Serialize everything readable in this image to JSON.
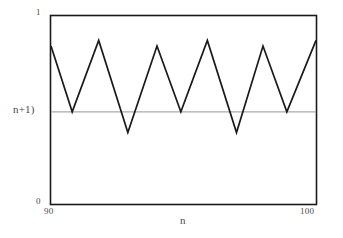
{
  "chart_data": {
    "type": "line",
    "title": "",
    "subtitle": "",
    "xlabel": "n",
    "ylabel": "",
    "xlim": [
      90,
      100
    ],
    "ylim": [
      0,
      1
    ],
    "grid": false,
    "legend": null,
    "xticks": [
      {
        "value": 90,
        "label": "90"
      },
      {
        "value": 100,
        "label": "100"
      }
    ],
    "yticks": [
      {
        "value": 0,
        "label": "0"
      },
      {
        "value": 0.49,
        "label": "n+1)"
      },
      {
        "value": 1,
        "label": "1"
      }
    ],
    "annotations": [
      {
        "name": "reference-line",
        "type": "horizontal-line",
        "y": 0.49,
        "label": "n+1)",
        "color": "#aaaaaa"
      }
    ],
    "series": [
      {
        "name": "oscillating-sequence",
        "color": "#1a1a1a",
        "x": [
          90.0,
          90.5,
          91.0,
          91.5,
          92.0,
          92.5,
          93.0,
          93.5,
          94.0,
          94.5,
          95.0,
          95.5,
          96.0,
          96.5,
          97.0,
          97.5,
          98.0,
          98.5,
          99.0,
          99.5,
          100.0
        ],
        "y": [
          0.84,
          0.49,
          0.87,
          0.38,
          0.84,
          0.49,
          0.85,
          0.38,
          0.87,
          0.49,
          0.85,
          0.38,
          0.84,
          0.49,
          0.87,
          0.38,
          0.85,
          0.49,
          0.84,
          0.38,
          0.87
        ]
      }
    ],
    "points": [
      {
        "x": 90.0,
        "y": 0.84
      },
      {
        "x": 90.8,
        "y": 0.49
      },
      {
        "x": 91.8,
        "y": 0.87
      },
      {
        "x": 92.9,
        "y": 0.38
      },
      {
        "x": 94.0,
        "y": 0.84
      },
      {
        "x": 94.9,
        "y": 0.49
      },
      {
        "x": 95.9,
        "y": 0.87
      },
      {
        "x": 97.0,
        "y": 0.38
      },
      {
        "x": 98.0,
        "y": 0.84
      },
      {
        "x": 98.9,
        "y": 0.49
      },
      {
        "x": 100.0,
        "y": 0.87
      }
    ],
    "axes_frame": {
      "box": true,
      "color": "#1a1a1a"
    }
  },
  "labels": {
    "y_top": "1",
    "y_bottom": "0",
    "y_mid": "n+1)",
    "x_start": "90",
    "x_end": "100",
    "x_title": "n"
  },
  "colors": {
    "background": "#ffffff",
    "frame": "#1a1a1a",
    "curve": "#1a1a1a",
    "reference_line": "#aaaaaa",
    "text": "#4a4a4a"
  }
}
